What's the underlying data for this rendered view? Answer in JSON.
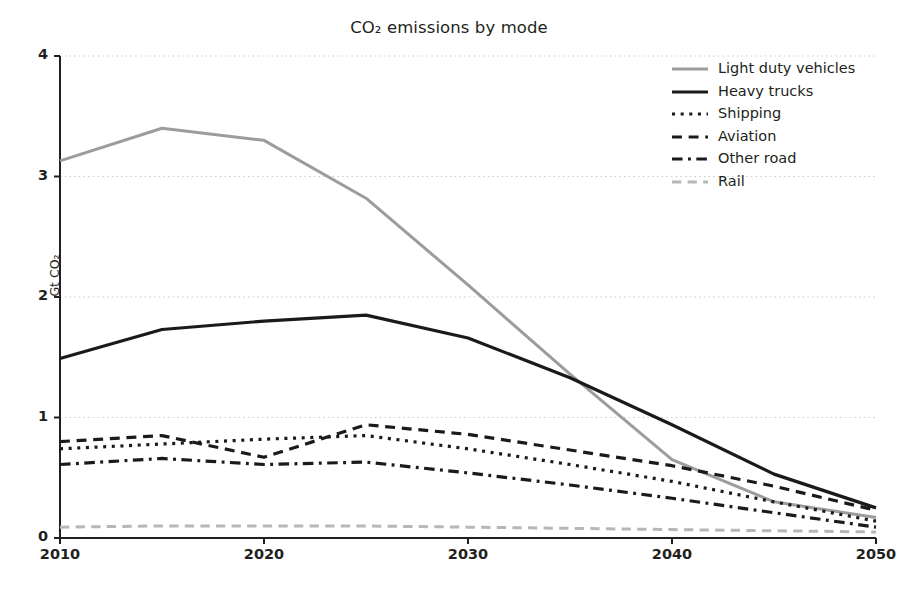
{
  "chart_data": {
    "type": "line",
    "title": "CO₂ emissions by mode",
    "xlabel": "",
    "ylabel": "Gt CO₂",
    "xlim": [
      2010,
      2050
    ],
    "ylim": [
      0,
      4
    ],
    "xticks": [
      "2010",
      "2020",
      "2030",
      "2040",
      "2050"
    ],
    "xtick_values": [
      2010,
      2020,
      2030,
      2040,
      2050
    ],
    "yticks": [
      "0",
      "1",
      "2",
      "3",
      "4"
    ],
    "ytick_values": [
      0,
      1,
      2,
      3,
      4
    ],
    "grid": "horizontal-dotted",
    "legend_position": "upper right",
    "x": [
      2010,
      2015,
      2020,
      2025,
      2030,
      2035,
      2040,
      2045,
      2050
    ],
    "series": [
      {
        "name": "Light duty vehicles",
        "color": "#9c9c9c",
        "style": "solid",
        "width": 3.0,
        "values": [
          3.13,
          3.4,
          3.3,
          2.82,
          2.1,
          1.36,
          0.65,
          0.3,
          0.17
        ]
      },
      {
        "name": "Heavy trucks",
        "color": "#1a1a1a",
        "style": "solid",
        "width": 3.2,
        "values": [
          1.49,
          1.73,
          1.8,
          1.85,
          1.66,
          1.33,
          0.94,
          0.53,
          0.25
        ]
      },
      {
        "name": "Shipping",
        "color": "#1a1a1a",
        "style": "dotted",
        "width": 3.2,
        "values": [
          0.74,
          0.78,
          0.82,
          0.85,
          0.74,
          0.61,
          0.47,
          0.3,
          0.14
        ]
      },
      {
        "name": "Aviation",
        "color": "#1a1a1a",
        "style": "dashed",
        "width": 3.2,
        "values": [
          0.8,
          0.85,
          0.67,
          0.94,
          0.86,
          0.73,
          0.6,
          0.43,
          0.23
        ]
      },
      {
        "name": "Other road",
        "color": "#1a1a1a",
        "style": "dashdot",
        "width": 3.2,
        "values": [
          0.61,
          0.66,
          0.61,
          0.63,
          0.54,
          0.44,
          0.33,
          0.21,
          0.09
        ]
      },
      {
        "name": "Rail",
        "color": "#b7b7b7",
        "style": "dashed",
        "width": 3.0,
        "values": [
          0.09,
          0.1,
          0.1,
          0.1,
          0.09,
          0.08,
          0.07,
          0.06,
          0.05
        ]
      }
    ]
  },
  "legend": {
    "items": [
      {
        "label": "Light duty vehicles"
      },
      {
        "label": "Heavy trucks"
      },
      {
        "label": "Shipping"
      },
      {
        "label": "Aviation"
      },
      {
        "label": "Other road"
      },
      {
        "label": "Rail"
      }
    ]
  }
}
